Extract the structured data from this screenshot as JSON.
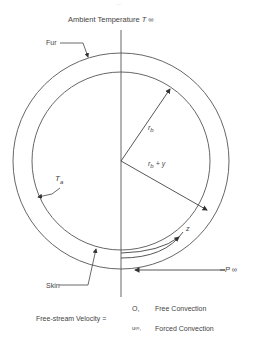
{
  "figure": {
    "page_fragment": "…",
    "title": "Ambient Temperature",
    "title_symbol": "T ∞",
    "labels": {
      "fur": "Fur",
      "skin": "Skin",
      "rb": "r",
      "rb_sub": "b",
      "rb_plus_y": "r",
      "rb_plus_y_sub": "b",
      "rb_plus_y_suffix": "+ y",
      "ta": "T",
      "ta_sub": "a",
      "z": "z",
      "p_inf": "P ∞"
    },
    "velocity": {
      "prefix": "Free-stream Velocity =",
      "case1_value": "O,",
      "case1_label": "Free Convection",
      "case2_value": "u∞,",
      "case2_label": "Forced Convection"
    },
    "colors": {
      "line": "#555555",
      "text": "#444444",
      "background": "#ffffff"
    }
  }
}
